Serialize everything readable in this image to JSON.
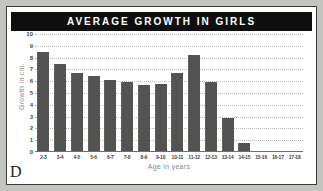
{
  "figure": {
    "panel_letter": "D",
    "title": "AVERAGE GROWTH IN GIRLS",
    "title_bg": "#0e0e0e",
    "title_color": "#ffffff",
    "bar_color": "#585856",
    "grid_color": "#b9b9b5",
    "axis_label_color": "#8a8a86"
  },
  "chart_data": {
    "type": "bar",
    "title": "AVERAGE GROWTH IN GIRLS",
    "xlabel": "Age in years",
    "ylabel": "Growth in cm.",
    "ylim": [
      0,
      10
    ],
    "yticks": [
      10,
      9,
      8,
      7,
      6,
      5,
      4,
      3,
      2,
      1,
      0
    ],
    "grid": true,
    "legend": null,
    "categories": [
      "2-3",
      "3-4",
      "4-5",
      "5-6",
      "6-7",
      "7-8",
      "8-9",
      "9-10",
      "10-11",
      "11-12",
      "12-13",
      "13-14",
      "14-15",
      "15-16",
      "16-17",
      "17-18"
    ],
    "values": [
      8.5,
      7.5,
      6.7,
      6.4,
      6.1,
      5.9,
      5.7,
      5.8,
      6.7,
      8.2,
      5.9,
      2.9,
      0.8,
      0.1,
      0.0,
      0.0
    ]
  }
}
